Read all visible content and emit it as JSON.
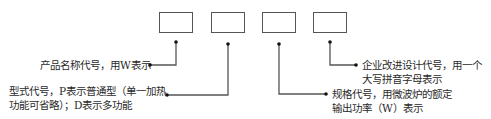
{
  "diagram": {
    "boxes": [
      {
        "id": "box-1",
        "x": 159,
        "y": 12
      },
      {
        "id": "box-2",
        "x": 211,
        "y": 12
      },
      {
        "id": "box-3",
        "x": 262,
        "y": 12
      },
      {
        "id": "box-4",
        "x": 313,
        "y": 12
      }
    ],
    "labels": {
      "product_name_code": "产品名称代号，用W表示",
      "model_code_line1": "型式代号，P表示普通型（单一加热",
      "model_code_line2": "功能可省略）；D表示多功能",
      "spec_code_line1": "规格代号，用微波炉的额定",
      "spec_code_line2": "输出功率（W）表示",
      "design_code_line1": "企业改进设计代号，用一个",
      "design_code_line2": "大写拼音字母表示"
    },
    "colors": {
      "line": "#555555",
      "text": "#2a2a2a"
    }
  }
}
